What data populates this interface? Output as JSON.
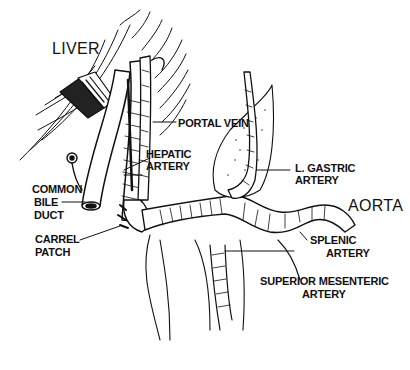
{
  "diagram": {
    "type": "anatomical-illustration",
    "colors": {
      "ink": "#111111",
      "background": "#ffffff",
      "stipple": "#333333"
    },
    "labels": {
      "liver": "LIVER",
      "portal_vein": "PORTAL VEIN",
      "hepatic_artery_1": "HEPATIC",
      "hepatic_artery_2": "ARTERY",
      "common_bile_duct_1": "COMMON",
      "common_bile_duct_2": "BILE",
      "common_bile_duct_3": "DUCT",
      "carrel_patch_1": "CARREL",
      "carrel_patch_2": "PATCH",
      "l_gastric_artery_1": "L. GASTRIC",
      "l_gastric_artery_2": "ARTERY",
      "aorta": "AORTA",
      "splenic_artery_1": "SPLENIC",
      "splenic_artery_2": "ARTERY",
      "superior_mesenteric_artery_1": "SUPERIOR MESENTERIC",
      "superior_mesenteric_artery_2": "ARTERY"
    }
  }
}
